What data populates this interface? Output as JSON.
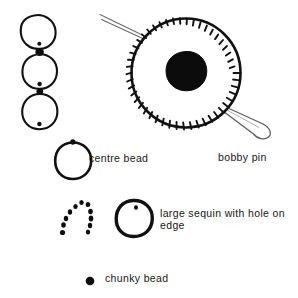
{
  "figure": {
    "type": "hand-drawn craft illustration",
    "background_color": "#ffffff",
    "ink_color": "#111111"
  },
  "labels": {
    "centre_bead": "centre bead",
    "bobby_pin": "bobby pin",
    "large_sequin": "large sequin with hole on edge",
    "chunky_bead": "chunky bead"
  },
  "legend": [
    {
      "key": "centre_bead",
      "label": "centre bead",
      "swatch": "sequin-with-top-hole"
    },
    {
      "key": "bobby_pin",
      "label": "bobby pin",
      "swatch": "serrated-sequin-on-pin"
    },
    {
      "key": "large_sequin",
      "label": "large sequin with hole on edge",
      "swatch": "thick-outline-sequin"
    },
    {
      "key": "chunky_bead",
      "label": "chunky bead",
      "swatch": "solid-dot"
    }
  ],
  "drawings": {
    "bead_chain": {
      "name": "stacked sequin chain",
      "sequin_count": 3,
      "connector_bead_count": 2
    },
    "main_assembly": {
      "name": "large serrated sequin threaded on a bobby pin",
      "serration_count": 46,
      "centre_bead": "solid black chunky bead"
    },
    "scattered_beads": {
      "name": "loose chunky beads arranged in an arc",
      "bead_count": 11
    }
  }
}
